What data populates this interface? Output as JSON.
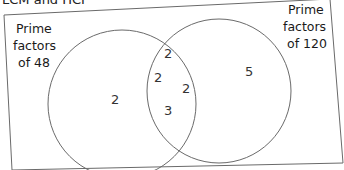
{
  "heading": "LCM and HCF",
  "diagram": {
    "type": "venn",
    "sets": [
      {
        "id": "A",
        "label_lines": [
          "Prime",
          "factors",
          "of 48"
        ],
        "only_elements": [
          "2"
        ]
      },
      {
        "id": "B",
        "label_lines": [
          "Prime",
          "factors",
          "of 120"
        ],
        "only_elements": [
          "5"
        ]
      }
    ],
    "intersection_elements": [
      "2",
      "2",
      "2",
      "3"
    ],
    "colors": {
      "lines": "#6a6a6a",
      "text": "#222222",
      "background": "#ffffff"
    }
  }
}
